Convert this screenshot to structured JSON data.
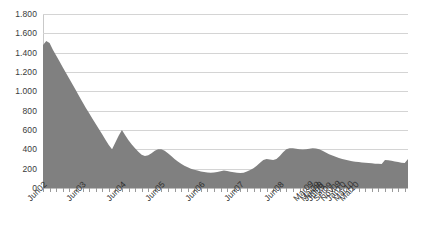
{
  "chart_data": {
    "type": "area",
    "title": "",
    "subtitle": "",
    "xlabel": "",
    "ylabel": "",
    "ylim": [
      0,
      1800
    ],
    "y_tick_labels": [
      "1.800",
      "1.600",
      "1.400",
      "1.200",
      "1.000",
      "800",
      "600",
      "400",
      "200",
      "0"
    ],
    "y_tick_values": [
      1800,
      1600,
      1400,
      1200,
      1000,
      800,
      600,
      400,
      200,
      0
    ],
    "grid": true,
    "legend": "none",
    "series_color": "#808080",
    "gridline_color": "#d4d4d4",
    "x_tick_labels": [
      "Jun02",
      "Jun03",
      "Jun04",
      "Jun05",
      "Jun06",
      "Jun07",
      "Jun08",
      "Jun09",
      "Mar09",
      "Mai09",
      "Jul09",
      "Set09",
      "Nov09",
      "Jan10",
      "Mar10",
      "Mai10"
    ],
    "x_label_point_index": [
      0,
      12,
      24,
      36,
      48,
      60,
      72,
      84,
      81,
      83,
      85,
      87,
      89,
      91,
      93,
      95
    ],
    "categories": [
      "Jun02",
      "Jul02",
      "Ago02",
      "Set02",
      "Out02",
      "Nov02",
      "Dez02",
      "Jan03",
      "Fev03",
      "Mar03",
      "Abr03",
      "Mai03",
      "Jun03",
      "Jul03",
      "Ago03",
      "Set03",
      "Out03",
      "Nov03",
      "Dez03",
      "Jan04",
      "Fev04",
      "Mar04",
      "Abr04",
      "Mai04",
      "Jun04",
      "Jul04",
      "Ago04",
      "Set04",
      "Out04",
      "Nov04",
      "Dez04",
      "Jan05",
      "Fev05",
      "Mar05",
      "Abr05",
      "Mai05",
      "Jun05",
      "Jul05",
      "Ago05",
      "Set05",
      "Out05",
      "Nov05",
      "Dez05",
      "Jan06",
      "Fev06",
      "Mar06",
      "Abr06",
      "Mai06",
      "Jun06",
      "Jul06",
      "Ago06",
      "Set06",
      "Out06",
      "Nov06",
      "Dez06",
      "Jan07",
      "Fev07",
      "Mar07",
      "Abr07",
      "Mai07",
      "Jun07",
      "Jul07",
      "Ago07",
      "Set07",
      "Out07",
      "Nov07",
      "Dez07",
      "Jan08",
      "Fev08",
      "Mar08",
      "Abr08",
      "Mai08",
      "Jun08",
      "Jul08",
      "Ago08",
      "Set08",
      "Out08",
      "Nov08",
      "Dez08",
      "Jan09",
      "Fev09",
      "Mar09",
      "Abr09",
      "Mai09",
      "Jun09",
      "Jul09",
      "Ago09",
      "Set09",
      "Out09",
      "Nov09",
      "Dez09",
      "Jan10",
      "Fev10",
      "Mar10",
      "Abr10",
      "Mai10"
    ],
    "values": [
      1480,
      1520,
      1500,
      1430,
      1370,
      1310,
      1250,
      1190,
      1130,
      1070,
      1010,
      950,
      890,
      830,
      775,
      720,
      665,
      610,
      555,
      500,
      445,
      400,
      470,
      540,
      600,
      545,
      495,
      450,
      410,
      375,
      345,
      330,
      340,
      360,
      385,
      400,
      400,
      385,
      360,
      330,
      300,
      275,
      250,
      230,
      215,
      200,
      190,
      180,
      170,
      165,
      160,
      158,
      160,
      165,
      172,
      180,
      175,
      168,
      162,
      158,
      155,
      158,
      170,
      185,
      205,
      230,
      260,
      290,
      300,
      295,
      290,
      300,
      330,
      370,
      400,
      410,
      410,
      405,
      400,
      398,
      400,
      405,
      410,
      408,
      400,
      385,
      368,
      350,
      335,
      322,
      310,
      300,
      292,
      285,
      278,
      272
    ],
    "values_tail": [
      268,
      265,
      262,
      258,
      255,
      252,
      250,
      248,
      290,
      288,
      282,
      275,
      268,
      262,
      258,
      300
    ]
  }
}
